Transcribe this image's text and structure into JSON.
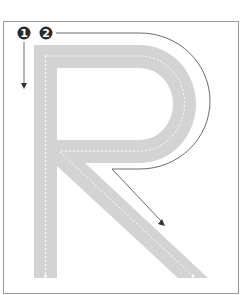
{
  "diagram": {
    "letter": "R",
    "stroke_labels": [
      {
        "number": "1",
        "description": "vertical stem stroke, downward"
      },
      {
        "number": "2",
        "description": "bowl and diagonal leg stroke"
      }
    ],
    "colors": {
      "frame": "#9a9a9a",
      "track": "#d3d3d3",
      "track_dash": "#ffffff",
      "guide_line": "#444444",
      "badge": "#2a2a2a"
    }
  }
}
